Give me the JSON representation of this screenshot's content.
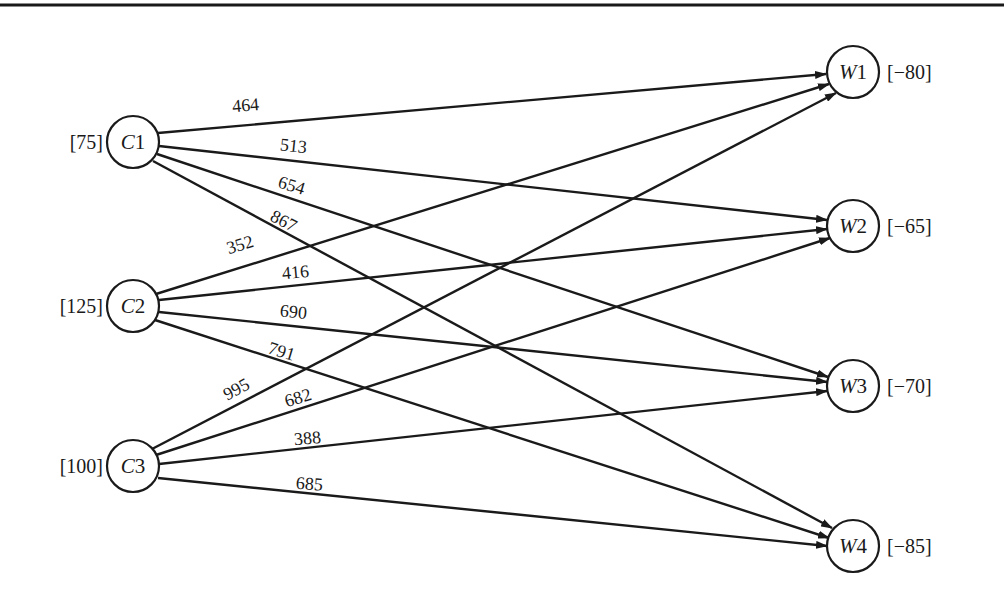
{
  "diagram": {
    "type": "transportation-network",
    "sources": [
      {
        "id": "C1",
        "letter": "C",
        "index": "1",
        "supply_label": "[75]",
        "supply": 75
      },
      {
        "id": "C2",
        "letter": "C",
        "index": "2",
        "supply_label": "[125]",
        "supply": 125
      },
      {
        "id": "C3",
        "letter": "C",
        "index": "3",
        "supply_label": "[100]",
        "supply": 100
      }
    ],
    "sinks": [
      {
        "id": "W1",
        "letter": "W",
        "index": "1",
        "demand_label": "[−80]",
        "demand": -80
      },
      {
        "id": "W2",
        "letter": "W",
        "index": "2",
        "demand_label": "[−65]",
        "demand": -65
      },
      {
        "id": "W3",
        "letter": "W",
        "index": "3",
        "demand_label": "[−70]",
        "demand": -70
      },
      {
        "id": "W4",
        "letter": "W",
        "index": "4",
        "demand_label": "[−85]",
        "demand": -85
      }
    ],
    "edges": [
      {
        "from": "C1",
        "to": "W1",
        "cost": "464"
      },
      {
        "from": "C1",
        "to": "W2",
        "cost": "513"
      },
      {
        "from": "C1",
        "to": "W3",
        "cost": "654"
      },
      {
        "from": "C1",
        "to": "W4",
        "cost": "867"
      },
      {
        "from": "C2",
        "to": "W1",
        "cost": "352"
      },
      {
        "from": "C2",
        "to": "W2",
        "cost": "416"
      },
      {
        "from": "C2",
        "to": "W3",
        "cost": "690"
      },
      {
        "from": "C2",
        "to": "W4",
        "cost": "791"
      },
      {
        "from": "C3",
        "to": "W1",
        "cost": "995"
      },
      {
        "from": "C3",
        "to": "W2",
        "cost": "682"
      },
      {
        "from": "C3",
        "to": "W3",
        "cost": "388"
      },
      {
        "from": "C3",
        "to": "W4",
        "cost": "685"
      }
    ],
    "colors": {
      "ink": "#1a1a1a",
      "background": "#ffffff"
    }
  }
}
